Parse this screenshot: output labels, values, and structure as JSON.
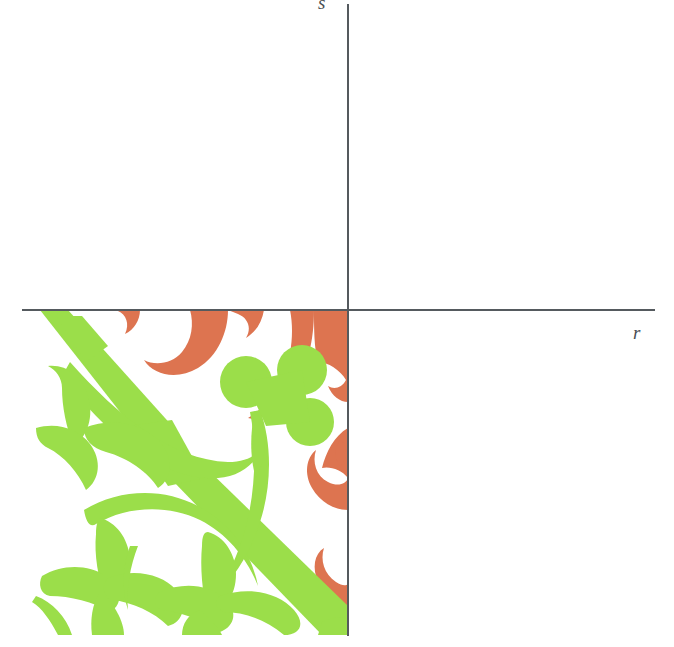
{
  "figure": {
    "title": "",
    "background_color": "#ffffff",
    "width": 674,
    "height": 647
  },
  "axes": {
    "color": "#555a5e",
    "horizontal": {
      "name": "r-axis",
      "label": "r",
      "label_style": "italic",
      "start_x": 22,
      "end_x": 655,
      "y": 309
    },
    "vertical": {
      "name": "s-axis",
      "label": "s",
      "label_style": "italic",
      "x": 347,
      "start_y": 4,
      "end_y": 636
    },
    "origin": {
      "x": 347,
      "y": 309
    }
  },
  "pattern": {
    "name": "floral-arabesque-tile",
    "quadrant": "third",
    "description": "Decorative floral tile filling the lower-left quadrant",
    "bounds": {
      "left": 22,
      "top": 310,
      "width": 326,
      "height": 325
    },
    "colors": {
      "green": "#9BDE4A",
      "orange": "#DD7450",
      "background": "#ffffff"
    },
    "motifs": [
      "diagonal-band",
      "curved-vine",
      "leaf-pair",
      "trefoil-leaf-lower-left",
      "trefoil-leaf-lower-center",
      "clover-flower",
      "orange-scallop-top",
      "orange-scroll-right"
    ]
  }
}
